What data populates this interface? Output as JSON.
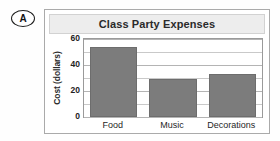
{
  "item_label": {
    "letter": "A",
    "shape": "oval-badge"
  },
  "figure": {
    "title": "Class Party Expenses"
  },
  "chart_data": {
    "type": "bar",
    "title": "Class Party Expenses",
    "xlabel": "",
    "ylabel": "Cost (dollars)",
    "categories": [
      "Food",
      "Music",
      "Decorations"
    ],
    "values": [
      54,
      29,
      33
    ],
    "ylim": [
      0,
      60
    ],
    "yticks": [
      0,
      20,
      40,
      60
    ],
    "ytick_labels": [
      "0",
      "20",
      "40",
      "60"
    ],
    "minor_tick_step": 10,
    "grid": true,
    "grid_axis": "y",
    "legend": false,
    "bar_color": "#7c7c7c",
    "plot_background": "#ffffff",
    "title_band_color": "#ededed",
    "frame_color": "#aaaaaa"
  }
}
